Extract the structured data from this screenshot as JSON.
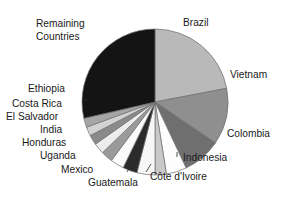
{
  "chart_data": {
    "type": "pie",
    "title": "",
    "subtitle": "",
    "xlabel": "",
    "ylabel": "",
    "legend_position": "none",
    "grid": false,
    "labels_on_slices": false,
    "label_placement": "outside-with-leader-lines",
    "start_angle_deg": 0,
    "direction": "clockwise",
    "categories": [
      "Brazil",
      "Vietnam",
      "Colombia",
      "Indonesia",
      "Côte d'Ivoire",
      "Guatemala",
      "Mexico",
      "Uganda",
      "Honduras",
      "India",
      "El Salvador",
      "Costa Rica",
      "Ethiopia",
      "Remaining Countries"
    ],
    "values": [
      22.0,
      12.5,
      8.5,
      4.5,
      2.5,
      4.0,
      3.2,
      3.0,
      2.6,
      2.4,
      2.2,
      2.0,
      2.0,
      28.6
    ],
    "colors": [
      "#b9b9b9",
      "#8f8f8f",
      "#6f6f6f",
      "#fdfdfd",
      "#c9c9c9",
      "#f7f7f7",
      "#2b2b2b",
      "#fbfbfb",
      "#9a9a9a",
      "#ededed",
      "#8a8a8a",
      "#d2d2d2",
      "#a6a6a6",
      "#141414"
    ]
  },
  "slices": [
    {
      "name": "Brazil",
      "value": 22.0,
      "color": "#b9b9b9",
      "label": "Brazil"
    },
    {
      "name": "Vietnam",
      "value": 12.5,
      "color": "#8f8f8f",
      "label": "Vietnam"
    },
    {
      "name": "Colombia",
      "value": 8.5,
      "color": "#6f6f6f",
      "label": "Colombia"
    },
    {
      "name": "Indonesia",
      "value": 4.5,
      "color": "#fdfdfd",
      "label": "Indonesia"
    },
    {
      "name": "Cote d'Ivoire",
      "value": 2.5,
      "color": "#c9c9c9",
      "label": "Côte d'Ivoire"
    },
    {
      "name": "Guatemala",
      "value": 4.0,
      "color": "#f7f7f7",
      "label": "Guatemala"
    },
    {
      "name": "Mexico",
      "value": 3.2,
      "color": "#2b2b2b",
      "label": "Mexico"
    },
    {
      "name": "Uganda",
      "value": 3.0,
      "color": "#fbfbfb",
      "label": "Uganda"
    },
    {
      "name": "Honduras",
      "value": 2.6,
      "color": "#9a9a9a",
      "label": "Honduras"
    },
    {
      "name": "India",
      "value": 2.4,
      "color": "#ededed",
      "label": "India"
    },
    {
      "name": "El Salvador",
      "value": 2.2,
      "color": "#8a8a8a",
      "label": "El Salvador"
    },
    {
      "name": "Costa Rica",
      "value": 2.0,
      "color": "#d2d2d2",
      "label": "Costa Rica"
    },
    {
      "name": "Ethiopia",
      "value": 2.0,
      "color": "#a6a6a6",
      "label": "Ethiopia"
    },
    {
      "name": "Remaining Countries",
      "value": 28.6,
      "color": "#141414",
      "label": "Remaining"
    }
  ],
  "labels": {
    "brazil": "Brazil",
    "vietnam": "Vietnam",
    "colombia": "Colombia",
    "indonesia": "Indonesia",
    "cote_divoire": "Côte d'Ivoire",
    "guatemala": "Guatemala",
    "mexico": "Mexico",
    "uganda": "Uganda",
    "honduras": "Honduras",
    "india": "India",
    "el_salvador": "El Salvador",
    "costa_rica": "Costa Rica",
    "ethiopia": "Ethiopia",
    "remaining_line1": "Remaining",
    "remaining_line2": "Countries"
  },
  "geometry": {
    "cx": 155,
    "cy": 102,
    "r": 73
  }
}
